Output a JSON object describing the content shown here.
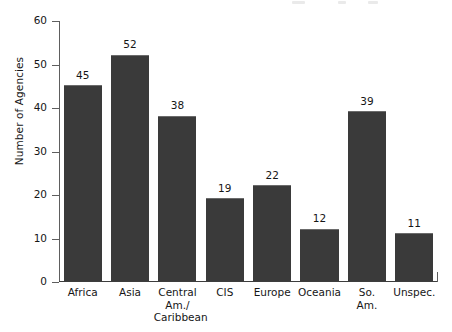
{
  "chart_data": {
    "type": "bar",
    "title": "",
    "subtitle": "",
    "xlabel": "",
    "ylabel": "Number of Agencies",
    "categories": [
      "Africa",
      "Asia",
      "Central Am./Caribbean",
      "CIS",
      "Europe",
      "Oceania",
      "So. Am.",
      "Unspec."
    ],
    "category_lines": [
      [
        "Africa"
      ],
      [
        "Asia"
      ],
      [
        "Central",
        "Am./",
        "Caribbean"
      ],
      [
        "CIS"
      ],
      [
        "Europe"
      ],
      [
        "Oceania"
      ],
      [
        "So.",
        "Am."
      ],
      [
        "Unspec."
      ]
    ],
    "values": [
      45,
      52,
      38,
      19,
      22,
      12,
      39,
      11
    ],
    "value_labels": [
      "45",
      "52",
      "38",
      "19",
      "22",
      "12",
      "39",
      "11"
    ],
    "ylim": [
      0,
      60
    ],
    "yticks": [
      0,
      10,
      20,
      30,
      40,
      50,
      60
    ],
    "ytick_labels": [
      "0",
      "10",
      "20",
      "30",
      "40",
      "50",
      "60"
    ],
    "grid": false,
    "legend": false,
    "legend_position": "none",
    "bar_color": "#3a3a3a",
    "axis_color": "#3d3d3d",
    "text_color": "#161616",
    "background_color": "#ffffff"
  }
}
